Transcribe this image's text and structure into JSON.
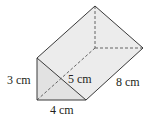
{
  "figure": {
    "type": "triangular-prism",
    "colors": {
      "face": "#e9e9e9",
      "face_light": "#f1f1f1",
      "edge": "#3a3a3a",
      "hidden_edge": "#555555"
    },
    "labels": {
      "height": "3 cm",
      "hypotenuse": "5 cm",
      "base": "4 cm",
      "length": "8 cm"
    }
  }
}
